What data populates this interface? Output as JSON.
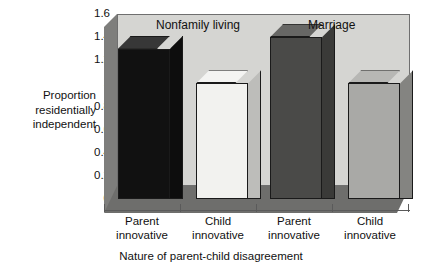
{
  "chart_data": {
    "type": "bar",
    "title": "",
    "xlabel": "Nature of parent-child disagreement",
    "ylabel": "Proportion residentially independent",
    "ylim": [
      0,
      1.6
    ],
    "grid": false,
    "legend": "none",
    "style": "3d-bar",
    "categories": [
      "Parent innovative",
      "Child innovative",
      "Parent innovative",
      "Child innovative"
    ],
    "values": [
      1.3,
      1.0,
      1.4,
      1.0
    ],
    "groups": [
      {
        "label": "Nonfamily living",
        "categories": [
          "Parent innovative",
          "Child innovative"
        ],
        "values": [
          1.3,
          1.0
        ]
      },
      {
        "label": "Marriage",
        "categories": [
          "Parent innovative",
          "Child innovative"
        ],
        "values": [
          1.4,
          1.0
        ]
      }
    ],
    "bar_colors": [
      "#111111",
      "#f2f2ef",
      "#4a4a48",
      "#a9a9a6"
    ],
    "yticks": [
      "0",
      "0.2",
      "0.4",
      "0.6",
      "0.8",
      "1",
      "1.2",
      "1.4",
      "1.6"
    ],
    "ytick_values": [
      0,
      0.2,
      0.4,
      0.6,
      0.8,
      1.0,
      1.2,
      1.4,
      1.6
    ]
  },
  "axes": {
    "y_title_lines": [
      "Proportion",
      "residentially",
      "independent"
    ],
    "x_title": "Nature of parent-child disagreement"
  },
  "group_labels": {
    "left": "Nonfamily living",
    "right": "Marriage"
  },
  "x_labels": [
    {
      "line1": "Parent",
      "line2": "innovative"
    },
    {
      "line1": "Child",
      "line2": "innovative"
    },
    {
      "line1": "Parent",
      "line2": "innovative"
    },
    {
      "line1": "Child",
      "line2": "innovative"
    }
  ],
  "colors": {
    "plot_background": "#d5d5d2",
    "left_wall": "#7e7e7c",
    "floor": "#6e6e6c",
    "outline": "#1a1a1a",
    "bar1": "#111111",
    "bar2": "#f2f2ef",
    "bar3": "#4a4a48",
    "bar4": "#a9a9a6"
  }
}
